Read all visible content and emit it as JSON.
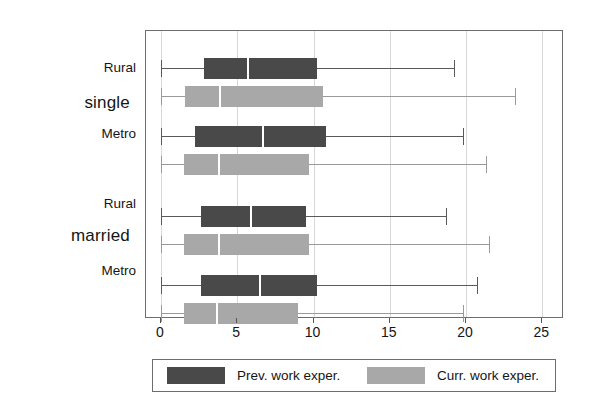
{
  "chart_data": {
    "type": "box",
    "title": "",
    "xlabel": "",
    "ylabel": "",
    "orientation": "horizontal",
    "xlim": [
      0,
      25.8
    ],
    "xticks": [
      0,
      5,
      10,
      15,
      20,
      25
    ],
    "xtick_labels": [
      "0",
      "5",
      "10",
      "15",
      "20",
      "25"
    ],
    "grid": true,
    "legend_position": "below",
    "colors": {
      "prev_work_exper": "#494949",
      "curr_work_exper": "#a8a8a8",
      "frame": "#6e6e6e",
      "gridline": "#d8d8d8",
      "median": "#ffffff"
    },
    "series": [
      {
        "name": "Prev. work exper.",
        "key": "prev",
        "color": "#494949"
      },
      {
        "name": "Curr. work exper.",
        "key": "curr",
        "color": "#a8a8a8"
      }
    ],
    "groups": [
      {
        "label": "single",
        "categories": [
          {
            "label": "Rural",
            "boxes": [
              {
                "series": "Prev. work exper.",
                "min": 0.0,
                "q1": 2.8,
                "median": 5.7,
                "q3": 10.2,
                "max": 19.2
              },
              {
                "series": "Curr. work exper.",
                "min": 0.0,
                "q1": 1.6,
                "median": 3.9,
                "q3": 10.6,
                "max": 23.2
              }
            ]
          },
          {
            "label": "Metro",
            "boxes": [
              {
                "series": "Prev. work exper.",
                "min": 0.0,
                "q1": 2.2,
                "median": 6.7,
                "q3": 10.8,
                "max": 19.8
              },
              {
                "series": "Curr. work exper.",
                "min": 0.0,
                "q1": 1.5,
                "median": 3.8,
                "q3": 9.7,
                "max": 21.3
              }
            ]
          }
        ]
      },
      {
        "label": "married",
        "categories": [
          {
            "label": "Rural",
            "boxes": [
              {
                "series": "Prev. work exper.",
                "min": 0.0,
                "q1": 2.6,
                "median": 5.9,
                "q3": 9.5,
                "max": 18.7
              },
              {
                "series": "Curr. work exper.",
                "min": 0.0,
                "q1": 1.5,
                "median": 3.8,
                "q3": 9.7,
                "max": 21.5
              }
            ]
          },
          {
            "label": "Metro",
            "boxes": [
              {
                "series": "Prev. work exper.",
                "min": 0.0,
                "q1": 2.6,
                "median": 6.5,
                "q3": 10.2,
                "max": 20.7
              },
              {
                "series": "Curr. work exper.",
                "min": 0.0,
                "q1": 1.5,
                "median": 3.7,
                "q3": 9.0,
                "max": 19.8
              }
            ]
          }
        ]
      }
    ]
  },
  "legend": {
    "entries": [
      {
        "label": "Prev. work exper.",
        "color": "#494949"
      },
      {
        "label": "Curr. work exper.",
        "color": "#a8a8a8"
      }
    ]
  }
}
